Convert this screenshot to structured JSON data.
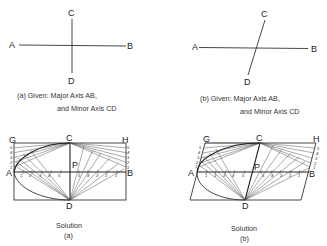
{
  "figure_a_given": {
    "labels": {
      "A": "A",
      "B": "B",
      "C": "C",
      "D": "D"
    },
    "caption_line1": "(a) Given: Major Axis AB,",
    "caption_line2": "and Minor Axis CD"
  },
  "figure_b_given": {
    "labels": {
      "A": "A",
      "B": "B",
      "C": "C",
      "D": "D"
    },
    "caption_line1": "(b) Given: Major Axis AB,",
    "caption_line2": "and Minor Axis CD"
  },
  "solution_a": {
    "labels": {
      "G": "G",
      "H": "H",
      "C": "C",
      "P": "P",
      "A": "A",
      "B": "B",
      "D": "D"
    },
    "caption_line1": "Solution",
    "caption_line2": "(a)",
    "side_divisions": [
      "1",
      "2",
      "3",
      "4",
      "5"
    ],
    "axis_divisions": [
      "1",
      "2",
      "3",
      "4",
      "5"
    ]
  },
  "solution_b": {
    "labels": {
      "G": "G",
      "H": "H",
      "C": "C",
      "P": "P",
      "A": "A",
      "B": "B",
      "D": "D"
    },
    "caption_line1": "Solution",
    "caption_line2": "(b)",
    "side_divisions": [
      "1",
      "2",
      "3",
      "4",
      "5"
    ],
    "axis_divisions": [
      "1",
      "2",
      "3",
      "4",
      "5"
    ]
  }
}
